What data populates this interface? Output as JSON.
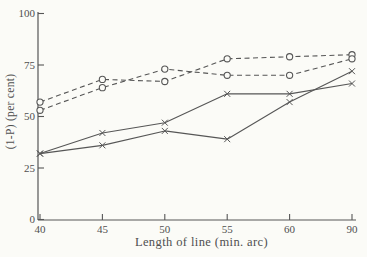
{
  "figure": {
    "background": "#fbfbf7",
    "ink": "#565656",
    "text_color": "#4f4f4f"
  },
  "chart_data": {
    "type": "line",
    "title": "",
    "xlabel": "Length of line (min. arc)",
    "ylabel": "(1-P) (per cent)",
    "x_tick_labels": [
      "40",
      "45",
      "50",
      "55",
      "60",
      "90"
    ],
    "categories": [
      40,
      45,
      50,
      55,
      60,
      90
    ],
    "y_ticks": [
      0,
      25,
      50,
      75,
      100
    ],
    "y_tick_labels": [
      "0",
      "25",
      "50",
      "75",
      "100"
    ],
    "ylim": [
      0,
      100
    ],
    "grid": false,
    "legend": "none",
    "series": [
      {
        "name": "dashed-circle-a",
        "line": "dashed",
        "marker": "circle",
        "values": [
          57,
          68,
          67,
          78,
          79,
          80
        ]
      },
      {
        "name": "dashed-circle-b",
        "line": "dashed",
        "marker": "circle",
        "values": [
          53,
          64,
          73,
          70,
          70,
          78
        ]
      },
      {
        "name": "solid-cross-a",
        "line": "solid",
        "marker": "x",
        "values": [
          32,
          42,
          47,
          61,
          61,
          66
        ]
      },
      {
        "name": "solid-cross-b",
        "line": "solid",
        "marker": "x",
        "values": [
          32,
          36,
          43,
          39,
          57,
          72
        ]
      }
    ]
  }
}
